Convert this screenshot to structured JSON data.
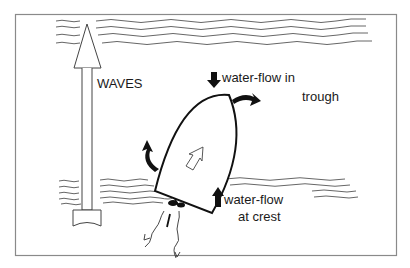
{
  "diagram": {
    "labels": {
      "waves": "WAVES",
      "trough_line1": "water-flow in",
      "trough_line2": "trough",
      "crest_line1": "water-flow",
      "crest_line2": "at crest"
    },
    "colors": {
      "ink": "#1a1a1a",
      "wave_line": "#555555",
      "frame": "#888888",
      "background": "#ffffff"
    }
  }
}
